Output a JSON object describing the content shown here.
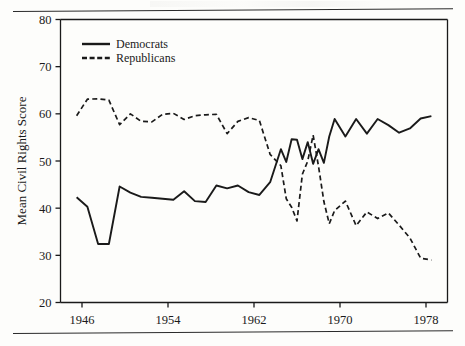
{
  "figure": {
    "background_color": "#fdfdfb",
    "ink_color": "#1a1a1a"
  },
  "axes": {
    "ylabel": "Mean Civil Rights Score",
    "y_ticks": [
      "20",
      "30",
      "40",
      "50",
      "60",
      "70",
      "80"
    ],
    "x_ticks": [
      "1946",
      "1954",
      "1962",
      "1970",
      "1978"
    ]
  },
  "legend": {
    "items": [
      {
        "label": "Democrats",
        "style": "solid"
      },
      {
        "label": "Republicans",
        "style": "dashed"
      }
    ]
  },
  "chart_data": {
    "type": "line",
    "title": "",
    "xlabel": "",
    "ylabel": "Mean Civil Rights Score",
    "xlim": [
      1944,
      1980
    ],
    "ylim": [
      20,
      80
    ],
    "ytick_values": [
      20,
      30,
      40,
      50,
      60,
      70,
      80
    ],
    "xtick_values": [
      1946,
      1954,
      1962,
      1970,
      1978
    ],
    "grid": false,
    "legend_position": "upper-left-inside",
    "x": [
      1945,
      1947,
      1949,
      1951,
      1953,
      1955,
      1957,
      1959,
      1961,
      1963,
      1965,
      1967,
      1969,
      1971,
      1973,
      1975,
      1977,
      1979
    ],
    "series": [
      {
        "name": "Democrats",
        "style": "solid",
        "color": "#1a1a1a",
        "x": [
          1945.5,
          1946.5,
          1947.5,
          1948.5,
          1949.5,
          1950.5,
          1951.5,
          1952.5,
          1953.5,
          1954.5,
          1955.5,
          1956.5,
          1957.5,
          1958.5,
          1959.5,
          1960.5,
          1961.5,
          1962.5,
          1963.5,
          1964.5,
          1965.0,
          1965.5,
          1966.0,
          1966.5,
          1967.0,
          1967.5,
          1968.0,
          1968.5,
          1969.0,
          1969.5,
          1970.5,
          1971.5,
          1972.5,
          1973.5,
          1974.5,
          1975.5,
          1976.5,
          1977.5,
          1978.5
        ],
        "values": [
          42.3,
          40.3,
          32.4,
          32.4,
          44.6,
          43.3,
          42.4,
          42.2,
          42.0,
          41.8,
          43.6,
          41.5,
          41.3,
          44.8,
          44.2,
          44.8,
          43.4,
          42.8,
          45.5,
          52.5,
          49.8,
          54.6,
          54.5,
          50.4,
          54.0,
          49.4,
          52.5,
          49.6,
          55.2,
          58.9,
          55.2,
          58.9,
          55.8,
          58.9,
          57.6,
          56.0,
          56.9,
          59.0,
          59.5
        ]
      },
      {
        "name": "Republicans",
        "style": "dashed",
        "color": "#1a1a1a",
        "x": [
          1945.5,
          1946.5,
          1947.5,
          1948.5,
          1949.5,
          1950.5,
          1951.5,
          1952.5,
          1953.5,
          1954.5,
          1955.5,
          1956.5,
          1957.5,
          1958.5,
          1959.5,
          1960.5,
          1961.5,
          1962.5,
          1963.5,
          1964.5,
          1965.0,
          1965.5,
          1966.0,
          1966.5,
          1967.0,
          1967.5,
          1968.0,
          1968.5,
          1969.0,
          1969.5,
          1970.5,
          1971.5,
          1972.5,
          1973.5,
          1974.5,
          1975.5,
          1976.5,
          1977.5,
          1978.5
        ],
        "values": [
          59.6,
          63.1,
          63.2,
          62.9,
          57.7,
          60.0,
          58.4,
          58.3,
          59.9,
          60.1,
          58.8,
          59.6,
          59.8,
          59.9,
          55.8,
          58.4,
          59.2,
          58.6,
          51.4,
          49.0,
          42.0,
          40.2,
          37.3,
          47.2,
          50.0,
          55.5,
          48.9,
          41.4,
          36.7,
          39.5,
          41.5,
          36.3,
          39.2,
          37.8,
          39.0,
          36.4,
          33.7,
          29.4,
          29.0
        ]
      }
    ]
  }
}
